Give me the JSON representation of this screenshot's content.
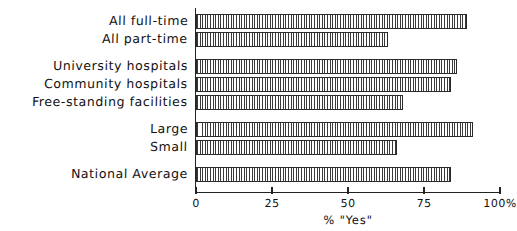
{
  "chart_data": {
    "type": "bar",
    "orientation": "horizontal",
    "title": "",
    "xlabel": "% \"Yes\"",
    "ylabel": "",
    "xlim": [
      0,
      100
    ],
    "xticks": [
      0,
      25,
      50,
      75,
      100
    ],
    "xticklabels": [
      "0",
      "25",
      "50",
      "75",
      "100%"
    ],
    "grid": false,
    "legend": null,
    "categories": [
      "All full-time",
      "All part-time",
      "University hospitals",
      "Community hospitals",
      "Free-standing facilities",
      "Large",
      "Small",
      "National Average"
    ],
    "values": [
      89,
      63,
      86,
      84,
      68,
      91,
      66,
      84
    ],
    "groups": [
      {
        "name": "staffing",
        "categories": [
          "All full-time",
          "All part-time"
        ]
      },
      {
        "name": "facility-type",
        "categories": [
          "University hospitals",
          "Community hospitals",
          "Free-standing facilities"
        ]
      },
      {
        "name": "size",
        "categories": [
          "Large",
          "Small"
        ]
      },
      {
        "name": "overall",
        "categories": [
          "National Average"
        ]
      }
    ],
    "bar_style": {
      "fill": "vertical-hatch",
      "edge_color": "#2a2a2a",
      "hatch_color": "#3a3a3a",
      "background": "#ffffff"
    }
  },
  "axis": {
    "title": "% \"Yes\"",
    "tick_labels": [
      "0",
      "25",
      "50",
      "75",
      "100%"
    ]
  },
  "labels": {
    "c0": "All full-time",
    "c1": "All part-time",
    "c2": "University hospitals",
    "c3": "Community hospitals",
    "c4": "Free-standing facilities",
    "c5": "Large",
    "c6": "Small",
    "c7": "National Average"
  }
}
